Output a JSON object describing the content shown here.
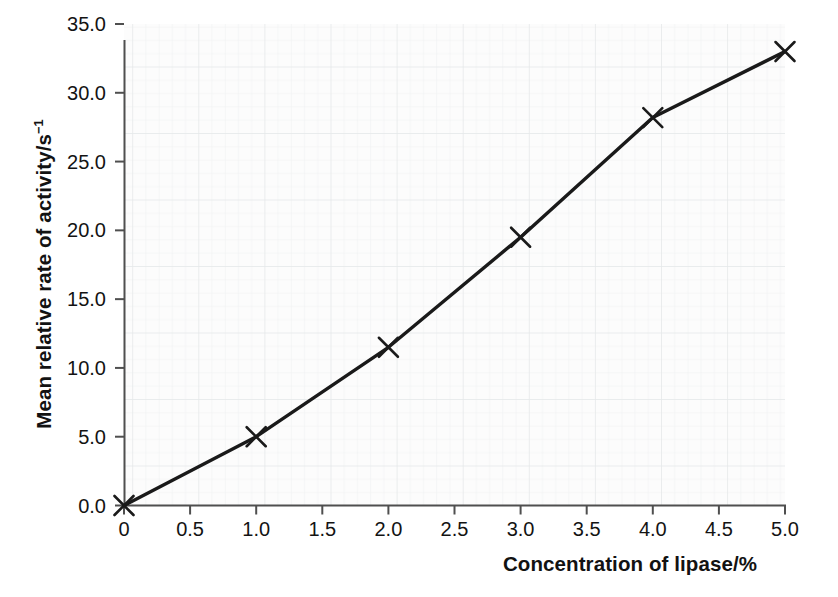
{
  "chart_data": {
    "type": "line",
    "title": "",
    "subtitle": "",
    "xlabel": "Concentration of lipase/%",
    "ylabel": "Mean relative rate of activity/s⁻¹",
    "ylabel_main": "Mean relative rate of activity/s",
    "ylabel_exponent": "−1",
    "x": [
      0,
      1.0,
      2.0,
      3.0,
      4.0,
      5.0
    ],
    "values": [
      0.0,
      5.0,
      11.5,
      19.5,
      28.2,
      33.0
    ],
    "series": [
      {
        "name": "Mean relative rate of activity",
        "x": [
          0,
          1.0,
          2.0,
          3.0,
          4.0,
          5.0
        ],
        "values": [
          0.0,
          5.0,
          11.5,
          19.5,
          28.2,
          33.0
        ]
      }
    ],
    "xlim": [
      0,
      5.0
    ],
    "ylim": [
      0,
      35.0
    ],
    "xticks": [
      0,
      0.5,
      1.0,
      1.5,
      2.0,
      2.5,
      3.0,
      3.5,
      4.0,
      4.5,
      5.0
    ],
    "xtick_labels": [
      "0",
      "0.5",
      "1.0",
      "1.5",
      "2.0",
      "2.5",
      "3.0",
      "3.5",
      "4.0",
      "4.5",
      "5.0"
    ],
    "yticks": [
      0.0,
      5.0,
      10.0,
      15.0,
      20.0,
      25.0,
      30.0,
      35.0
    ],
    "ytick_labels": [
      "0.0",
      "5.0",
      "10.0",
      "15.0",
      "20.0",
      "25.0",
      "30.0",
      "35.0"
    ],
    "grid": true,
    "grid_style": "graph-paper",
    "legend": false,
    "legend_position": "none",
    "marker": "x-cross",
    "line_color": "#1a1a1a",
    "marker_color": "#1a1a1a",
    "grid_color": "#eceeef",
    "axis_color": "#555555",
    "background_color": "#ffffff",
    "plot_background_color": "#fcfcfc"
  }
}
